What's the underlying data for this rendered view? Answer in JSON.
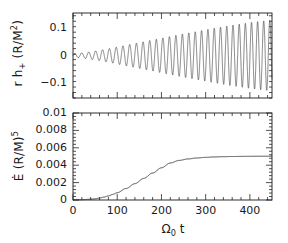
{
  "figure": {
    "width": 288,
    "height": 243,
    "background": "#ffffff",
    "line_color": "#303030",
    "axis_color": "#1a1a1a"
  },
  "axes": {
    "xlabel_parts": {
      "symbol": "Ω",
      "subscript": "0",
      "variable": "t"
    },
    "xlabel_plain": "Ω₀ t",
    "xticks": [
      0,
      100,
      200,
      300,
      400
    ],
    "xtick_labels": [
      "0",
      "100",
      "200",
      "300",
      "400"
    ],
    "xlim": [
      0,
      450
    ],
    "x_minor_step": 20
  },
  "chart_data": [
    {
      "type": "line",
      "id": "waveform-panel",
      "title": "",
      "xlabel": "",
      "ylabel": "r h_+ (R/M^2)",
      "ylabel_plain": "r h₊ (R/M²)",
      "xlim": [
        0,
        450
      ],
      "ylim": [
        -0.155,
        0.155
      ],
      "yticks": [
        0.1,
        0,
        -0.1
      ],
      "ytick_labels": [
        "0.1",
        "0",
        "−0.1"
      ],
      "y_minor_step": 0.02,
      "grid": false,
      "legend": null,
      "description": "Oscillatory gravitational waveform with linearly growing amplitude envelope",
      "envelope": {
        "x": [
          0,
          25,
          50,
          75,
          100,
          125,
          150,
          175,
          200,
          225,
          250,
          275,
          300,
          325,
          350,
          375,
          400,
          425,
          450
        ],
        "amplitude": [
          0.006,
          0.01,
          0.016,
          0.023,
          0.031,
          0.039,
          0.047,
          0.055,
          0.063,
          0.071,
          0.079,
          0.086,
          0.094,
          0.101,
          0.108,
          0.114,
          0.12,
          0.125,
          0.129
        ]
      },
      "oscillation": {
        "phase_freq_start": 0.395,
        "phase_freq_end": 0.46,
        "cycles_approx": 31
      }
    },
    {
      "type": "line",
      "id": "luminosity-panel",
      "title": "",
      "xlabel": "Ω₀ t",
      "ylabel": "Edot (R/M)^5",
      "ylabel_plain": "Ė (R/M)⁵",
      "xlim": [
        0,
        450
      ],
      "ylim": [
        0,
        0.01
      ],
      "yticks": [
        0,
        0.002,
        0.004,
        0.006,
        0.008,
        0.01
      ],
      "ytick_labels": [
        "0",
        "0.002",
        "0.004",
        "0.006",
        "0.008",
        "0.01"
      ],
      "y_minor_step": 0.0004,
      "grid": false,
      "legend": null,
      "description": "Monotonic sigmoid rise of energy flux saturating near 0.005",
      "x": [
        0,
        20,
        40,
        50,
        60,
        70,
        80,
        90,
        100,
        120,
        140,
        160,
        180,
        200,
        220,
        240,
        260,
        280,
        300,
        320,
        340,
        360,
        380,
        400,
        420,
        440,
        450
      ],
      "y": [
        2e-05,
        4e-05,
        9e-05,
        0.00014,
        0.00022,
        0.00033,
        0.00047,
        0.00064,
        0.00084,
        0.00132,
        0.00188,
        0.00248,
        0.0031,
        0.0037,
        0.00425,
        0.00455,
        0.00472,
        0.00483,
        0.0049,
        0.00495,
        0.00498,
        0.005,
        0.00501,
        0.00502,
        0.00503,
        0.00503,
        0.00503
      ]
    }
  ]
}
